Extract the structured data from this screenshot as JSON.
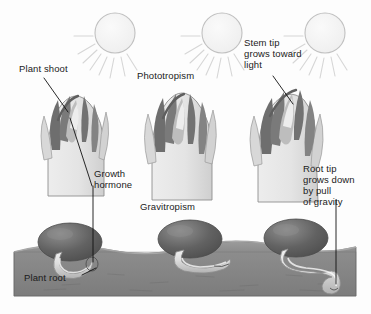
{
  "diagram": {
    "background_color": "#fdfdfd",
    "frame_color": "#bdbdbd",
    "palette": {
      "soil": "#8a8a8a",
      "soil_dark": "#6f6f6f",
      "soil_top_light": "#9a9a9a",
      "seed_dark": "#5a5a5a",
      "seed_light": "#8e8e8e",
      "root_light": "#e6e6e6",
      "root_shadow": "#b9b9b9",
      "shoot_body": "#e9e9e9",
      "shoot_mid": "#bfbfbf",
      "shoot_dark": "#6e6e6e",
      "outline": "#7a7a7a",
      "sun_fill": "#f2f2f2",
      "sun_stroke": "#bcbcbc",
      "ray": "#d8d8d8",
      "leader": "#111111",
      "text": "#1b1b1b"
    }
  },
  "labels": {
    "plant_shoot": "Plant shoot",
    "phototropism": "Phototropism",
    "stem_tip": "Stem tip\ngrows toward\nlight",
    "growth_hormone": "Growth\nhormone",
    "gravitropism": "Gravitropism",
    "root_tip": "Root tip\ngrows down\nby pull\nof gravity",
    "plant_root": "Plant root"
  },
  "scene": {
    "suns": [
      {
        "name": "sun-left",
        "cx": 115,
        "cy": 33,
        "r": 20
      },
      {
        "name": "sun-center",
        "cx": 222,
        "cy": 33,
        "r": 20
      },
      {
        "name": "sun-right",
        "cx": 325,
        "cy": 33,
        "r": 20
      }
    ],
    "shoots": [
      {
        "name": "shoot-upright",
        "stage": "Plant shoot",
        "lean": "upright"
      },
      {
        "name": "shoot-center",
        "stage": "Phototropism",
        "lean": "upright"
      },
      {
        "name": "shoot-bending",
        "stage": "Phototropism",
        "lean": "toward-light"
      }
    ],
    "seeds": [
      {
        "name": "seed-left",
        "root": "short-curled"
      },
      {
        "name": "seed-center",
        "root": "horizontal"
      },
      {
        "name": "seed-right",
        "root": "curving-down"
      }
    ],
    "soil": {
      "name": "soil-band",
      "top": 240,
      "bottom": 297
    }
  }
}
